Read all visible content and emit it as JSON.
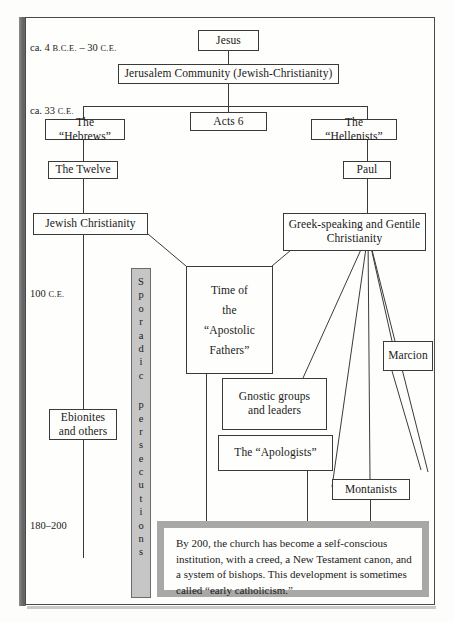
{
  "figure": {
    "kind": "flow-chart"
  },
  "eras": [
    {
      "id": "era-1",
      "prefix": "ca. 4 ",
      "smallcaps_1": "B.C.E.",
      "mid": " – 30 ",
      "smallcaps_2": "C.E.",
      "plain": ""
    },
    {
      "id": "era-2",
      "prefix": "ca. 33 ",
      "smallcaps_1": "C.E.",
      "mid": "",
      "smallcaps_2": "",
      "plain": ""
    },
    {
      "id": "era-3",
      "prefix": "100 ",
      "smallcaps_1": "C.E.",
      "mid": "",
      "smallcaps_2": "",
      "plain": ""
    },
    {
      "id": "era-4",
      "prefix": "180–200",
      "smallcaps_1": "",
      "mid": "",
      "smallcaps_2": "",
      "plain": ""
    }
  ],
  "nodes": {
    "jesus": "Jesus",
    "jerusalem": "Jerusalem Community (Jewish-Christianity)",
    "acts6": "Acts 6",
    "hebrews": "The “Hebrews”",
    "hellenists": "The “Hellenists”",
    "twelve": "The Twelve",
    "paul": "Paul",
    "jewish_christianity": "Jewish Christianity",
    "greek_gentile_line1": "Greek-speaking and Gentile",
    "greek_gentile_line2": "Christianity",
    "apostolic_l1": "Time of",
    "apostolic_l2": "the",
    "apostolic_l3": "“Apostolic",
    "apostolic_l4": "Fathers”",
    "gnostic_l1": "Gnostic groups",
    "gnostic_l2": "and leaders",
    "apologists": "The “Apologists”",
    "ebionites_l1": "Ebionites",
    "ebionites_l2": "and others",
    "marcion": "Marcion",
    "montanists": "Montanists"
  },
  "persecutions": {
    "label": "Sporadic persecutions",
    "word_1": [
      "S",
      "p",
      "o",
      "r",
      "a",
      "d",
      "i",
      "c"
    ],
    "word_2": [
      "p",
      "e",
      "r",
      "s",
      "e",
      "c",
      "u",
      "t",
      "i",
      "o",
      "n",
      "s"
    ]
  },
  "callout": {
    "text": "By 200, the church has become a self-conscious institution, with a creed, a New Testament canon, and a system of bishops. This development is sometimes called “early catholicism.”"
  },
  "colors": {
    "ink": "#1a1a1a",
    "rule": "#3a3a3a",
    "page": "#fefefc",
    "persecution_bar": "#c6c6c6",
    "callout_border": "#a8a8a8",
    "gutter": "#6e6e6e"
  }
}
